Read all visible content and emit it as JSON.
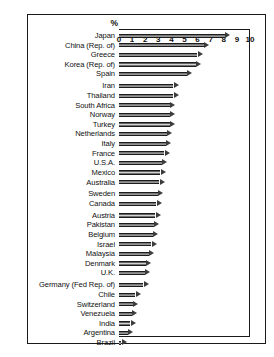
{
  "chart_data": {
    "type": "bar",
    "orientation": "horizontal",
    "title": "",
    "xlabel": "%",
    "ylabel": "",
    "xlim": [
      0,
      10
    ],
    "xticks": [
      0,
      1,
      2,
      3,
      4,
      5,
      6,
      7,
      8,
      9,
      10
    ],
    "tick_labels": [
      "0",
      "1",
      "2",
      "3",
      "4",
      "5",
      "6",
      "7",
      "8",
      "9",
      "10"
    ],
    "unit_symbol": "%",
    "grid": false,
    "legend": null,
    "bar_style": "arrow",
    "sorted": "descending",
    "categories": [
      "Japan",
      "China (Rep. of)",
      "Greece",
      "Korea (Rep. of)",
      "Spain",
      "Iran",
      "Thailand",
      "South Africa",
      "Norway",
      "Turkey",
      "Netherlands",
      "Italy",
      "France",
      "U.S.A.",
      "Mexico",
      "Australia",
      "Sweden",
      "Canada",
      "Austria",
      "Pakistan",
      "Belgium",
      "Israel",
      "Malaysia",
      "Denmark",
      "U.K.",
      "Germany (Fed Rep. of)",
      "Chile",
      "Switzerland",
      "Venezuela",
      "India",
      "Argentina",
      "Brazil"
    ],
    "values": [
      8.5,
      6.9,
      6.4,
      6.3,
      5.6,
      4.6,
      4.6,
      4.3,
      4.3,
      4.3,
      4.1,
      4.0,
      3.9,
      3.7,
      3.6,
      3.5,
      3.4,
      3.3,
      3.2,
      3.1,
      3.0,
      2.9,
      2.7,
      2.5,
      2.4,
      2.3,
      1.7,
      1.5,
      1.4,
      1.3,
      1.1,
      0.6
    ],
    "group_breaks_after": [
      "Spain",
      "Australia",
      "Canada",
      "U.K."
    ]
  },
  "colors": {
    "frame": "#1a1a1a",
    "text": "#111111",
    "bar_dark": "#2e2e2e",
    "bar_light": "#d8d8d8",
    "background": "#ffffff"
  }
}
